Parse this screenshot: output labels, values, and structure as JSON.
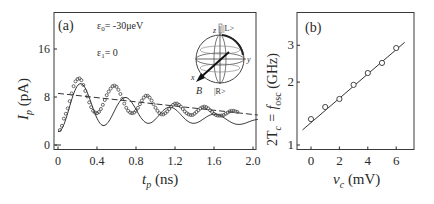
{
  "chart_data": [
    {
      "panel": "(a)",
      "type": "scatter",
      "title": "",
      "xlabel": "t_p (ns)",
      "ylabel": "I_p (pA)",
      "xlim": [
        -0.04,
        2.05
      ],
      "ylim": [
        -1,
        22
      ],
      "xticks": [
        0,
        0.4,
        0.8,
        1.2,
        1.6,
        2.0
      ],
      "xtick_labels": [
        "0",
        "0.4",
        "0.8",
        "1.2",
        "1.6",
        "2.0"
      ],
      "yticks": [
        0,
        8,
        16
      ],
      "ytick_labels": [
        "0",
        "8",
        "16"
      ],
      "grid": false,
      "annotations": [
        "ε0= -30μeV",
        "ε1= 0"
      ],
      "inset": {
        "type": "bloch-sphere",
        "labels": [
          "z",
          "|L>",
          "y",
          "x",
          "B",
          "|R>"
        ]
      },
      "series": [
        {
          "name": "measured",
          "style": "open-circles",
          "x": [
            0.02,
            0.04,
            0.06,
            0.08,
            0.1,
            0.12,
            0.14,
            0.16,
            0.18,
            0.2,
            0.22,
            0.24,
            0.26,
            0.28,
            0.3,
            0.32,
            0.34,
            0.36,
            0.38,
            0.4,
            0.42,
            0.44,
            0.46,
            0.48,
            0.5,
            0.52,
            0.54,
            0.56,
            0.58,
            0.6,
            0.62,
            0.64,
            0.66,
            0.68,
            0.7,
            0.72,
            0.74,
            0.76,
            0.78,
            0.8,
            0.82,
            0.84,
            0.86,
            0.88,
            0.9,
            0.92,
            0.94,
            0.96,
            0.98,
            1.0,
            1.02,
            1.04,
            1.06,
            1.08,
            1.1,
            1.12,
            1.14,
            1.16,
            1.18,
            1.2,
            1.22,
            1.24,
            1.26,
            1.28,
            1.3,
            1.32,
            1.34,
            1.36,
            1.38,
            1.4,
            1.42,
            1.44,
            1.46,
            1.48,
            1.5,
            1.52,
            1.54,
            1.56,
            1.58,
            1.6,
            1.62,
            1.64,
            1.66,
            1.68,
            1.7,
            1.72,
            1.74,
            1.76,
            1.78,
            1.8,
            1.82,
            1.84,
            1.86,
            1.88,
            1.9,
            1.92,
            1.94,
            1.96,
            1.98,
            2.0,
            2.02
          ],
          "y": [
            2.5,
            3.2,
            4.4,
            5.2,
            6.1,
            7.3,
            8.6,
            9.8,
            10.6,
            11.0,
            11.1,
            10.8,
            10.0,
            9.0,
            8.1,
            7.1,
            6.3,
            5.7,
            5.4,
            5.3,
            5.5,
            6.0,
            6.7,
            7.5,
            8.3,
            8.9,
            9.4,
            9.8,
            9.9,
            9.7,
            9.2,
            8.5,
            7.7,
            6.9,
            6.2,
            5.7,
            5.4,
            5.3,
            5.4,
            5.7,
            6.2,
            6.8,
            7.4,
            7.9,
            8.2,
            8.2,
            7.9,
            7.4,
            6.8,
            6.2,
            5.7,
            5.3,
            5.1,
            5.1,
            5.3,
            5.6,
            6.0,
            6.4,
            6.7,
            6.9,
            6.9,
            6.7,
            6.4,
            6.0,
            5.6,
            5.3,
            5.1,
            5.0,
            5.0,
            5.2,
            5.5,
            5.8,
            6.1,
            6.3,
            6.4,
            6.3,
            6.1,
            5.8,
            5.5,
            5.2,
            5.0,
            4.9,
            4.9,
            4.9,
            5.0,
            5.2,
            5.4,
            5.6,
            5.7,
            5.7,
            5.6,
            5.5
          ],
          "note": "raw data points approximated from pixels"
        },
        {
          "name": "fit (damped cosine)",
          "style": "solid-line",
          "model": "y = 7.2*exp(-x/3.5) - 0.2 + A*exp(-x/0.9)*cos(2*pi*x/0.46 + phase)",
          "x_range": [
            0.0,
            2.05
          ]
        },
        {
          "name": "envelope",
          "style": "dashed-line",
          "x": [
            0.0,
            2.05
          ],
          "y": [
            8.6,
            5.0
          ]
        }
      ]
    },
    {
      "panel": "(b)",
      "type": "scatter",
      "title": "",
      "xlabel": "v_c (mV)",
      "ylabel": "2T_c = f_osc (GHz)",
      "xlim": [
        -1,
        7.2
      ],
      "ylim": [
        0.95,
        3.8
      ],
      "yscale": "log",
      "xticks": [
        0,
        2,
        4,
        6
      ],
      "xtick_labels": [
        "0",
        "2",
        "4",
        "6"
      ],
      "yticks": [
        1,
        2,
        3
      ],
      "ytick_labels": [
        "1",
        "2",
        "3"
      ],
      "grid": false,
      "series": [
        {
          "name": "measured",
          "style": "open-circles",
          "x": [
            0,
            1,
            2,
            3,
            4,
            5,
            6
          ],
          "y": [
            1.33,
            1.52,
            1.66,
            1.94,
            2.21,
            2.47,
            2.91
          ]
        },
        {
          "name": "exponential fit",
          "style": "solid-line",
          "x": [
            -0.6,
            6.6
          ],
          "y": [
            1.18,
            3.1
          ]
        }
      ]
    }
  ],
  "panel_a": {
    "label": "(a)",
    "annotation_eps0": "ε",
    "annotation_eps0_sub": "0",
    "annotation_eps0_value": "= -30μeV",
    "annotation_eps1": "ε",
    "annotation_eps1_sub": "1",
    "annotation_eps1_value": "= 0",
    "xlabel_main": "t",
    "xlabel_sub": "p",
    "xlabel_unit": " (ns)",
    "ylabel_main": "I",
    "ylabel_sub": "p",
    "ylabel_unit": " (pA)",
    "inset": {
      "z_label": "z",
      "L_label": "|L>",
      "y_label": "y",
      "x_label": "x",
      "B_label": "B",
      "R_label": "|R>"
    }
  },
  "panel_b": {
    "label": "(b)",
    "ylabel_main": "2T",
    "ylabel_sub": "c",
    "ylabel_eq": " = f",
    "ylabel_sub2": "osc",
    "ylabel_unit": " (GHz)",
    "xlabel_main": "v",
    "xlabel_sub": "c",
    "xlabel_unit": " (mV)"
  },
  "colors": {
    "ink": "#2a2a2a",
    "frame": "#3a3a3a",
    "background": "#ffffff"
  }
}
